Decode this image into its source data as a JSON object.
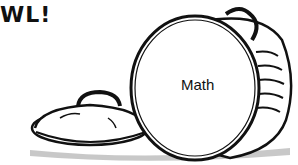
{
  "illustration": {
    "headline_text": "WL!",
    "can_label": "Math",
    "colors": {
      "ink": "#111111",
      "background": "#ffffff"
    }
  }
}
